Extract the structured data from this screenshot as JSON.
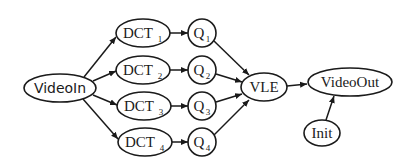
{
  "diagram": {
    "type": "directed-graph",
    "nodes": {
      "videoin": {
        "label": "VideoIn"
      },
      "dct1": {
        "label": "DCT",
        "sub": "1"
      },
      "dct2": {
        "label": "DCT",
        "sub": "2"
      },
      "dct3": {
        "label": "DCT",
        "sub": "3"
      },
      "dct4": {
        "label": "DCT",
        "sub": "4"
      },
      "q1": {
        "label": "Q",
        "sub": "1"
      },
      "q2": {
        "label": "Q",
        "sub": "2"
      },
      "q3": {
        "label": "Q",
        "sub": "3"
      },
      "q4": {
        "label": "Q",
        "sub": "4"
      },
      "vle": {
        "label": "VLE"
      },
      "videoout": {
        "label": "VideoOut"
      },
      "init": {
        "label": "Init"
      }
    },
    "edges": [
      [
        "VideoIn",
        "DCT1"
      ],
      [
        "VideoIn",
        "DCT2"
      ],
      [
        "VideoIn",
        "DCT3"
      ],
      [
        "VideoIn",
        "DCT4"
      ],
      [
        "DCT1",
        "Q1"
      ],
      [
        "DCT2",
        "Q2"
      ],
      [
        "DCT3",
        "Q3"
      ],
      [
        "DCT4",
        "Q4"
      ],
      [
        "Q1",
        "VLE"
      ],
      [
        "Q2",
        "VLE"
      ],
      [
        "Q3",
        "VLE"
      ],
      [
        "Q4",
        "VLE"
      ],
      [
        "VLE",
        "VideoOut"
      ],
      [
        "Init",
        "VideoOut"
      ]
    ],
    "colors": {
      "stroke": "#1a1a1a",
      "background": "#ffffff"
    }
  }
}
